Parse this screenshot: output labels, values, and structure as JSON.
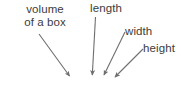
{
  "figure": {
    "type": "annotated-formula-diagram",
    "width": 191,
    "height": 96,
    "background_color": "#ffffff",
    "text_color": "#3c3c3c",
    "arrow_color": "#6e6e6e",
    "formula_color": "#2e2e2e"
  },
  "labels": {
    "volume_line1": "volume",
    "volume_line2": "of a box",
    "length": "length",
    "width": "width",
    "height": "height"
  },
  "formula": {
    "variable": "v",
    "operator": "=",
    "expression": "lwh",
    "full_text": "v = lwh"
  },
  "annotations": [
    {
      "label": "volume of a box",
      "points_to": "v",
      "arrow": "long diagonal from upper-left down-right"
    },
    {
      "label": "length",
      "points_to": "l",
      "arrow": "near-vertical, slight left lean"
    },
    {
      "label": "width",
      "points_to": "w",
      "arrow": "short diagonal from upper-right down-left"
    },
    {
      "label": "height",
      "points_to": "h",
      "arrow": "short diagonal from upper-right down-left"
    }
  ]
}
